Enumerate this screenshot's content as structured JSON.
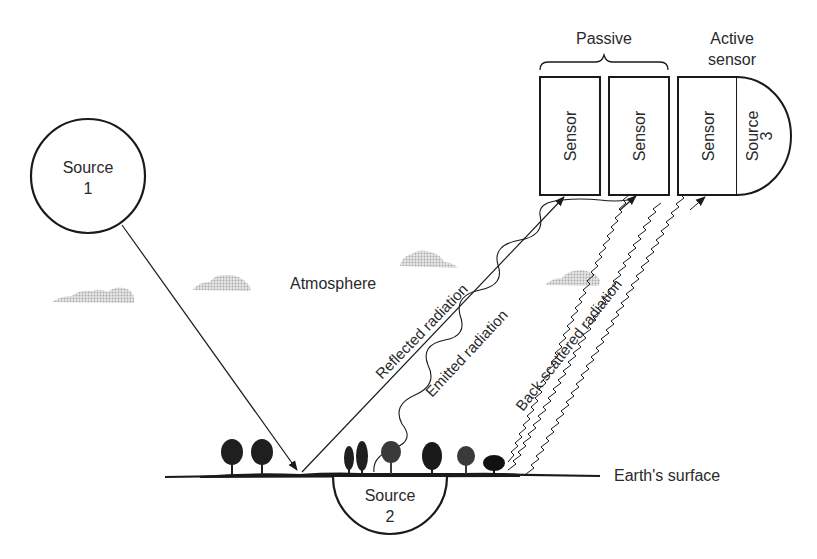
{
  "diagram": {
    "type": "remote-sensing-radiation-sources",
    "labels": {
      "source1_title": "Source",
      "source1_num": "1",
      "source2_title": "Source",
      "source2_num": "2",
      "source3_title": "Source",
      "source3_num": "3",
      "sensor1": "Sensor",
      "sensor2": "Sensor",
      "sensor3": "Sensor",
      "passive": "Passive",
      "active_line1": "Active",
      "active_line2": "sensor",
      "atmosphere": "Atmosphere",
      "earth_surface": "Earth's surface",
      "reflected": "Reflected radiation",
      "emitted": "Emitted radiation",
      "backscattered": "Back-scattered radiation"
    },
    "colors": {
      "stroke": "#1a1a1a",
      "text": "#2a2a2a",
      "cloud": "#c8c8c8"
    }
  }
}
